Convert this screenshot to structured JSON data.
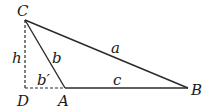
{
  "diagram": {
    "type": "triangle-with-altitude",
    "colors": {
      "line": "#2a2a2a",
      "background": "#ffffff"
    },
    "points": {
      "C": {
        "label": "C",
        "x": 25,
        "y": 20
      },
      "D": {
        "label": "D",
        "x": 25,
        "y": 88
      },
      "A": {
        "label": "A",
        "x": 65,
        "y": 88
      },
      "B": {
        "label": "B",
        "x": 188,
        "y": 88
      }
    },
    "segments": {
      "a": {
        "label": "a",
        "from": "C",
        "to": "B",
        "style": "solid"
      },
      "b": {
        "label": "b",
        "from": "C",
        "to": "A",
        "style": "solid"
      },
      "c": {
        "label": "c",
        "from": "A",
        "to": "B",
        "style": "solid"
      },
      "h": {
        "label": "h",
        "from": "C",
        "to": "D",
        "style": "dashed"
      },
      "b_prime": {
        "label": "b′",
        "from": "D",
        "to": "A",
        "style": "dashed"
      }
    }
  }
}
